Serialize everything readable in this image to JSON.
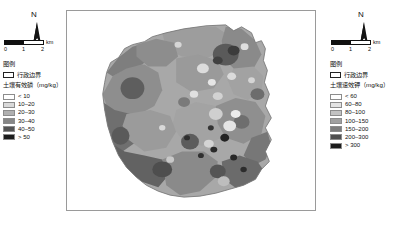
{
  "figure": {
    "kind": "two-panel-choropleth-map",
    "background": "#ffffff"
  },
  "left_panel": {
    "north_arrow": {
      "label": "N",
      "icon": "north-arrow-icon"
    },
    "scalebar": {
      "unit": "km",
      "ticks": [
        "0",
        "1",
        "2"
      ],
      "segments": [
        "dark",
        "light"
      ]
    },
    "legend": {
      "title": "图例",
      "boundary_label": "行政边界",
      "subtitle": "土壤有效磷（mg/kg）",
      "classes": [
        {
          "label": "< 10",
          "color": "#ffffff"
        },
        {
          "label": "10–20",
          "color": "#d9d9d9"
        },
        {
          "label": "20–30",
          "color": "#b0b0b0"
        },
        {
          "label": "30–40",
          "color": "#878787"
        },
        {
          "label": "40–50",
          "color": "#555555"
        },
        {
          "label": "> 50",
          "color": "#1c1c1c"
        }
      ]
    }
  },
  "right_panel": {
    "north_arrow": {
      "label": "N",
      "icon": "north-arrow-icon"
    },
    "scalebar": {
      "unit": "km",
      "ticks": [
        "0",
        "1",
        "2"
      ],
      "segments": [
        "dark",
        "light"
      ]
    },
    "legend": {
      "title": "图例",
      "boundary_label": "行政边界",
      "subtitle": "土壤速效钾（mg/kg）",
      "classes": [
        {
          "label": "< 60",
          "color": "#ffffff"
        },
        {
          "label": "60–80",
          "color": "#e3e3e3"
        },
        {
          "label": "80–100",
          "color": "#c2c2c2"
        },
        {
          "label": "100–150",
          "color": "#a0a0a0"
        },
        {
          "label": "150–200",
          "color": "#7d7d7d"
        },
        {
          "label": "200–300",
          "color": "#4f4f4f"
        },
        {
          "label": "> 300",
          "color": "#1c1c1c"
        }
      ]
    }
  },
  "map": {
    "name": "soil-nutrient-interpolation-map",
    "frame_border_color": "#9a9a9a",
    "base_fill": "#a8a8a8",
    "outline_color": "#7a7a7a"
  }
}
